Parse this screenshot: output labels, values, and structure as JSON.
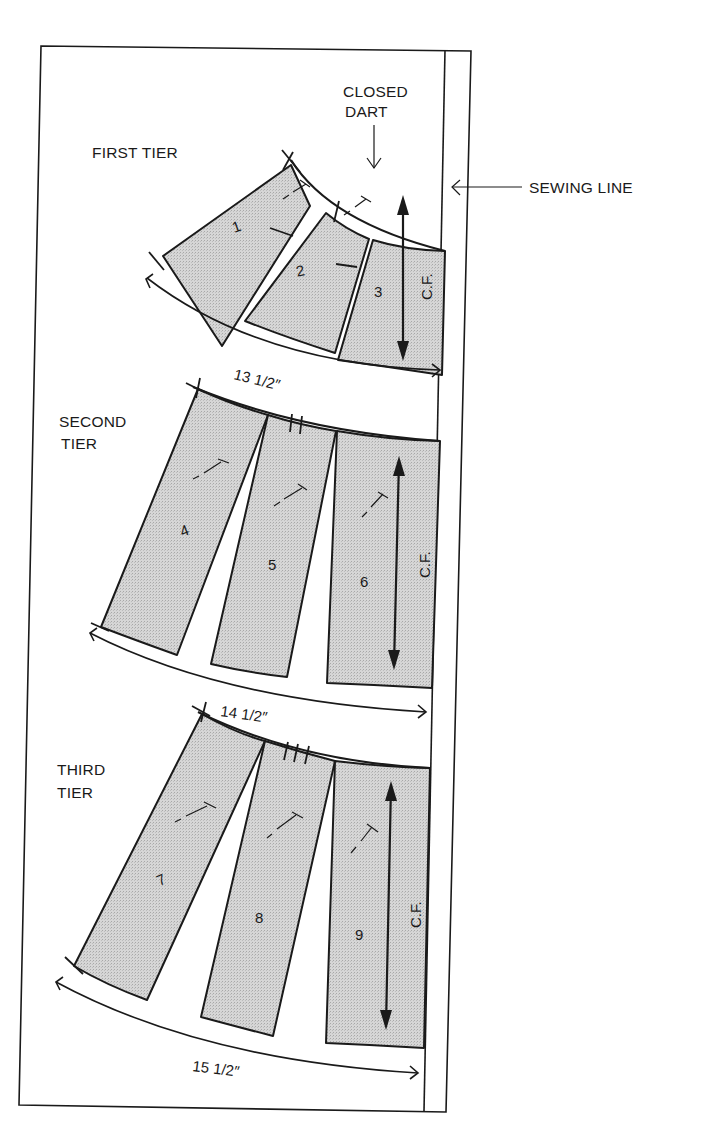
{
  "diagram": {
    "colors": {
      "ink": "#1a1a1a",
      "fill": "#cfcfcf",
      "paper": "#ffffff"
    },
    "labels": {
      "closed_dart_line1": "CLOSED",
      "closed_dart_line2": "DART",
      "sewing_line": "SEWING LINE"
    },
    "tiers": [
      {
        "label_line1": "FIRST TIER",
        "label_line2": "",
        "measurement": "13 1/2″",
        "notches": 1,
        "pieces": [
          "1",
          "2",
          "3"
        ],
        "grain_label": "C.F."
      },
      {
        "label_line1": "SECOND",
        "label_line2": "TIER",
        "measurement": "14 1/2″",
        "notches": 2,
        "pieces": [
          "4",
          "5",
          "6"
        ],
        "grain_label": "C.F."
      },
      {
        "label_line1": "THIRD",
        "label_line2": "TIER",
        "measurement": "15 1/2″",
        "notches": 3,
        "pieces": [
          "7",
          "8",
          "9"
        ],
        "grain_label": "C.F."
      }
    ]
  }
}
